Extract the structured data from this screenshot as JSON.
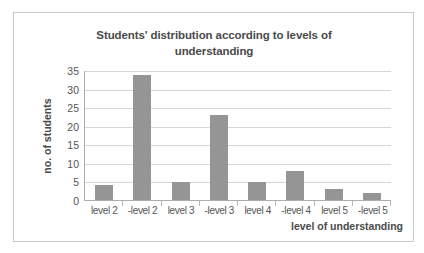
{
  "chart_data": {
    "type": "bar",
    "title": "Students' distribution according to levels of understanding",
    "title_line1": "Students' distribution according to levels of",
    "title_line2": "understanding",
    "xlabel": "level of understanding",
    "ylabel": "no. of students",
    "categories": [
      "level 2",
      "-level 2",
      "level 3",
      "-level 3",
      "level 4",
      "-level 4",
      "level 5",
      "-level 5"
    ],
    "values": [
      4,
      34,
      5,
      23,
      5,
      8,
      3,
      2
    ],
    "ylim": [
      0,
      35
    ],
    "yticks": [
      0,
      5,
      10,
      15,
      20,
      25,
      30,
      35
    ],
    "ytick_labels": [
      "0",
      "5",
      "10",
      "15",
      "20",
      "25",
      "30",
      "35"
    ],
    "grid": true,
    "legend": false,
    "bar_color": "#959595",
    "gridline_color": "#d6d6d6",
    "axis_color": "#adadad",
    "text_color": "#4a4a4a",
    "tick_text_color": "#565656",
    "border_color": "#c9c9c9",
    "background": "#ffffff"
  }
}
